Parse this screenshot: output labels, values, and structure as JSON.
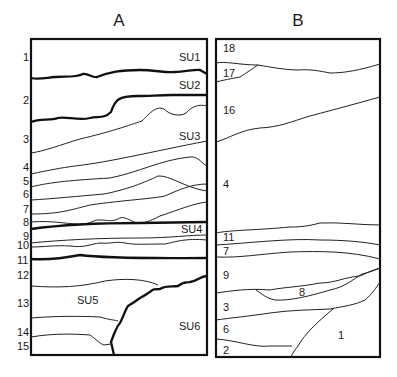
{
  "panels": {
    "A": {
      "title": "A",
      "frame": {
        "x": 31,
        "y": 39,
        "w": 176,
        "h": 316
      },
      "layer_numbers": [
        {
          "label": "1",
          "x": 23,
          "y": 61
        },
        {
          "label": "2",
          "x": 23,
          "y": 104
        },
        {
          "label": "3",
          "x": 23,
          "y": 143
        },
        {
          "label": "4",
          "x": 23,
          "y": 171
        },
        {
          "label": "5",
          "x": 23,
          "y": 185
        },
        {
          "label": "6",
          "x": 23,
          "y": 198
        },
        {
          "label": "7",
          "x": 23,
          "y": 213
        },
        {
          "label": "8",
          "x": 23,
          "y": 226
        },
        {
          "label": "9",
          "x": 23,
          "y": 240
        },
        {
          "label": "10",
          "x": 17,
          "y": 249
        },
        {
          "label": "11",
          "x": 17,
          "y": 264
        },
        {
          "label": "12",
          "x": 17,
          "y": 279
        },
        {
          "label": "13",
          "x": 17,
          "y": 307
        },
        {
          "label": "14",
          "x": 17,
          "y": 336
        },
        {
          "label": "15",
          "x": 17,
          "y": 350
        }
      ],
      "su_labels": [
        {
          "label": "SU1",
          "x": 179,
          "y": 61
        },
        {
          "label": "SU2",
          "x": 179,
          "y": 89
        },
        {
          "label": "SU3",
          "x": 179,
          "y": 140
        },
        {
          "label": "SU4",
          "x": 181,
          "y": 233
        },
        {
          "label": "SU5",
          "x": 77,
          "y": 304
        },
        {
          "label": "SU6",
          "x": 179,
          "y": 330
        }
      ],
      "lines_thick": [
        "M31,78 C38,80 45,78 55,77 C65,76 75,78 83,74 C88,73 92,78 97,77 C110,72 120,70 140,70 C155,70 165,73 175,72 C185,72 195,69 200,70 L207,74",
        "M31,122 C40,118 50,121 58,118 C66,116 78,121 90,118 C98,116 104,119 111,112 C115,100 118,96 138,96 C150,96 158,95 172,95 L207,95",
        "M31,229 C60,225 100,223 140,223 L207,222",
        "M31,259 C50,260 65,258 80,255 C110,259 160,258 207,258",
        "M207,276 C200,276 198,281 190,282 C186,283 184,281 178,286 C172,287 166,285 160,289 C150,289 155,290 140,298 C136,301 133,303 128,306 C125,310 123,318 120,323 C117,326 116,330 114,334 L111,342 L114,355"
      ],
      "lines_thin": [
        "M31,153 C45,151 60,145 80,139 C110,132 130,125 142,121 C148,115 156,105 164,109 C170,115 180,117 186,113 C192,106 200,104 207,106",
        "M31,174 C50,170 60,168 75,166 C110,162 150,152 207,141",
        "M31,187 C50,182 75,180 110,178 C140,172 160,160 190,157 C198,156 201,163 207,166",
        "M31,200 C50,199 80,196 104,194 C130,189 150,180 158,176 C170,175 185,188 207,191",
        "M31,214 C60,214 70,210 90,205 C125,200 150,199 165,196 C178,190 192,184 207,184",
        "M31,222 C55,220 70,225 84,224 C92,223 95,219 100,220 C108,220 112,222 118,219 C122,216 126,218 134,222 C142,225 150,221 160,216 C178,210 195,203 207,202",
        "M31,243 C60,240 100,238 140,238 C170,238 190,235 207,235",
        "M31,247 C45,247 55,245 70,246 C85,248 90,244 100,243 C112,244 115,241 125,243 C135,245 145,244 165,244 C175,242 185,238 207,240",
        "M31,286 C60,288 80,287 105,281 C125,278 145,279 158,285",
        "M31,318 C55,316 80,316 100,317 C110,320 115,320 118,321",
        "M31,337 C55,333 75,334 90,335 C96,339 100,344 104,345 L111,344"
      ]
    },
    "B": {
      "title": "B",
      "frame": {
        "x": 216,
        "y": 39,
        "w": 164,
        "h": 318
      },
      "layer_numbers": [
        {
          "label": "18",
          "x": 223,
          "y": 52
        },
        {
          "label": "17",
          "x": 223,
          "y": 77
        },
        {
          "label": "16",
          "x": 223,
          "y": 114
        },
        {
          "label": "4",
          "x": 223,
          "y": 188
        },
        {
          "label": "11",
          "x": 223,
          "y": 241
        },
        {
          "label": "7",
          "x": 223,
          "y": 255
        },
        {
          "label": "9",
          "x": 223,
          "y": 279
        },
        {
          "label": "8",
          "x": 299,
          "y": 296
        },
        {
          "label": "3",
          "x": 223,
          "y": 311
        },
        {
          "label": "6",
          "x": 223,
          "y": 333
        },
        {
          "label": "2",
          "x": 223,
          "y": 354
        },
        {
          "label": "1",
          "x": 338,
          "y": 339
        }
      ],
      "lines_thin": [
        "M216,63 C225,61 240,65 258,65 C270,67 285,70 298,70 C310,69 320,71 330,73 C345,73 360,70 380,64",
        "M216,82 C228,79 235,78 240,77 C248,72 253,68 258,65",
        "M216,142 C230,138 240,130 260,128 C280,127 290,122 310,116 C340,108 355,104 380,97",
        "M216,233 C230,230 260,230 290,227 C305,227 312,225 320,223 C340,222 360,225 380,225",
        "M216,245 C250,243 290,238 320,240 C345,240 365,242 380,245",
        "M216,257 C240,258 260,254 290,252 C320,251 350,251 380,259",
        "M216,293 C230,291 250,288 270,290 C285,287 300,287 320,283 C335,283 345,277 360,276 C367,273 372,270 380,268",
        "M256,290 C262,294 266,298 275,300 C290,301 310,296 330,290 C345,287 352,280 362,274 C370,272 376,270 380,268",
        "M216,320 C230,318 250,316 270,313 C290,310 310,310 330,309 C345,306 355,305 365,300 C372,294 376,288 380,282",
        "M216,339 C235,340 255,348 270,346 L292,346",
        "M333,309 C320,320 305,333 298,346 C295,350 293,352 291,357"
      ]
    }
  }
}
